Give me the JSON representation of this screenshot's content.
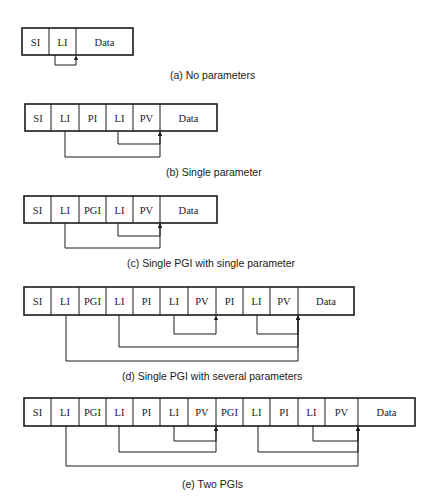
{
  "page": {
    "header": "266     CHAPTER 6"
  },
  "diagrams": [
    {
      "id": "a",
      "caption": "(a) No parameters",
      "caption_pos": [
        170,
        79
      ],
      "top": 28,
      "bottom": 55,
      "cells": [
        {
          "label": "SI",
          "x0": 22,
          "x1": 49
        },
        {
          "label": "LI",
          "x0": 49,
          "x1": 76
        },
        {
          "label": "Data",
          "x0": 76,
          "x1": 133
        }
      ],
      "links": [
        {
          "from_x": 55,
          "to_x": 76,
          "y": 65
        }
      ]
    },
    {
      "id": "b",
      "caption": "(b) Single parameter",
      "caption_pos": [
        166,
        176
      ],
      "top": 104,
      "bottom": 131,
      "cells": [
        {
          "label": "SI",
          "x0": 25,
          "x1": 51
        },
        {
          "label": "LI",
          "x0": 51,
          "x1": 79
        },
        {
          "label": "PI",
          "x0": 79,
          "x1": 106
        },
        {
          "label": "LI",
          "x0": 106,
          "x1": 133
        },
        {
          "label": "PV",
          "x0": 133,
          "x1": 160
        },
        {
          "label": "Data",
          "x0": 160,
          "x1": 217
        }
      ],
      "links": [
        {
          "from_x": 118,
          "to_x": 160,
          "y": 144
        },
        {
          "from_x": 65,
          "to_x": 160,
          "y": 157
        }
      ]
    },
    {
      "id": "c",
      "caption": "(c) Single PGI with single parameter",
      "caption_pos": [
        127,
        267
      ],
      "top": 196,
      "bottom": 223,
      "cells": [
        {
          "label": "SI",
          "x0": 24,
          "x1": 51
        },
        {
          "label": "LI",
          "x0": 51,
          "x1": 79
        },
        {
          "label": "PGI",
          "x0": 79,
          "x1": 106
        },
        {
          "label": "LI",
          "x0": 106,
          "x1": 133
        },
        {
          "label": "PV",
          "x0": 133,
          "x1": 160
        },
        {
          "label": "Data",
          "x0": 160,
          "x1": 217
        }
      ],
      "links": [
        {
          "from_x": 118,
          "to_x": 160,
          "y": 236
        },
        {
          "from_x": 65,
          "to_x": 160,
          "y": 248
        }
      ]
    },
    {
      "id": "d",
      "caption": "(d) Single PGI with several parameters",
      "caption_pos": [
        122,
        380
      ],
      "top": 287,
      "bottom": 315,
      "cells": [
        {
          "label": "SI",
          "x0": 24,
          "x1": 51
        },
        {
          "label": "LI",
          "x0": 51,
          "x1": 79
        },
        {
          "label": "PGI",
          "x0": 79,
          "x1": 106
        },
        {
          "label": "LI",
          "x0": 106,
          "x1": 133
        },
        {
          "label": "PI",
          "x0": 133,
          "x1": 160
        },
        {
          "label": "LI",
          "x0": 160,
          "x1": 188
        },
        {
          "label": "PV",
          "x0": 188,
          "x1": 216
        },
        {
          "label": "PI",
          "x0": 216,
          "x1": 243
        },
        {
          "label": "LI",
          "x0": 243,
          "x1": 270
        },
        {
          "label": "PV",
          "x0": 270,
          "x1": 298
        },
        {
          "label": "Data",
          "x0": 298,
          "x1": 354
        }
      ],
      "links": [
        {
          "from_x": 174,
          "to_x": 216,
          "y": 334
        },
        {
          "from_x": 257,
          "to_x": 298,
          "y": 334
        },
        {
          "from_x": 119,
          "to_x": 298,
          "y": 347
        },
        {
          "from_x": 66,
          "to_x": 298,
          "y": 361
        }
      ]
    },
    {
      "id": "e",
      "caption": "(e) Two PGIs",
      "caption_pos": [
        182,
        488
      ],
      "top": 398,
      "bottom": 426,
      "cells": [
        {
          "label": "SI",
          "x0": 24,
          "x1": 51
        },
        {
          "label": "LI",
          "x0": 51,
          "x1": 79
        },
        {
          "label": "PGI",
          "x0": 79,
          "x1": 106
        },
        {
          "label": "LI",
          "x0": 106,
          "x1": 133
        },
        {
          "label": "PI",
          "x0": 133,
          "x1": 160
        },
        {
          "label": "LI",
          "x0": 160,
          "x1": 188
        },
        {
          "label": "PV",
          "x0": 188,
          "x1": 216
        },
        {
          "label": "PGI",
          "x0": 216,
          "x1": 243
        },
        {
          "label": "LI",
          "x0": 243,
          "x1": 270
        },
        {
          "label": "PI",
          "x0": 270,
          "x1": 298
        },
        {
          "label": "LI",
          "x0": 298,
          "x1": 325
        },
        {
          "label": "PV",
          "x0": 325,
          "x1": 358
        },
        {
          "label": "Data",
          "x0": 358,
          "x1": 415
        }
      ],
      "links": [
        {
          "from_x": 174,
          "to_x": 216,
          "y": 441
        },
        {
          "from_x": 119,
          "to_x": 216,
          "y": 452
        },
        {
          "from_x": 313,
          "to_x": 358,
          "y": 441
        },
        {
          "from_x": 258,
          "to_x": 358,
          "y": 452
        },
        {
          "from_x": 66,
          "to_x": 358,
          "y": 466
        }
      ]
    }
  ]
}
